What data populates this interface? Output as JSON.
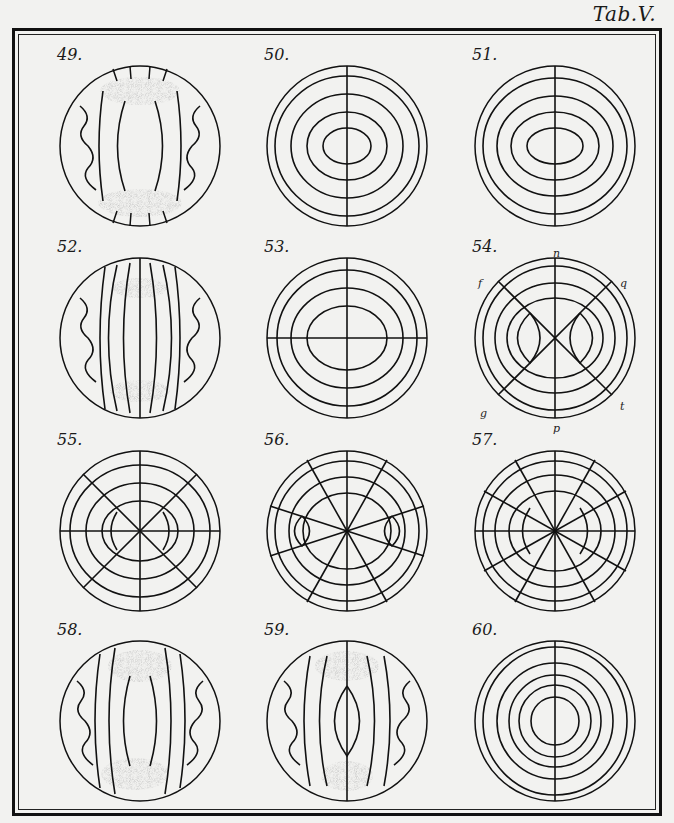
{
  "plate": {
    "title": "Tab.V."
  },
  "figures": [
    {
      "id": "49",
      "label": "49.",
      "type": "fringes-shaded"
    },
    {
      "id": "50",
      "label": "50.",
      "type": "rings-axis"
    },
    {
      "id": "51",
      "label": "51.",
      "type": "rings-axis"
    },
    {
      "id": "52",
      "label": "52.",
      "type": "fringes-shaded"
    },
    {
      "id": "53",
      "label": "53.",
      "type": "rings-cross"
    },
    {
      "id": "54",
      "label": "54.",
      "type": "rings-diagonal",
      "letters": [
        "n",
        "f",
        "q",
        "g",
        "t",
        "p"
      ]
    },
    {
      "id": "55",
      "label": "55.",
      "type": "radial-8"
    },
    {
      "id": "56",
      "label": "56.",
      "type": "radial-hyperbolic"
    },
    {
      "id": "57",
      "label": "57.",
      "type": "radial-12"
    },
    {
      "id": "58",
      "label": "58.",
      "type": "fringes-shaded"
    },
    {
      "id": "59",
      "label": "59.",
      "type": "fringes-shaded-axis"
    },
    {
      "id": "60",
      "label": "60.",
      "type": "rings-axis"
    }
  ],
  "colors": {
    "ink": "#111111",
    "paper": "#f2f2f0",
    "shade": "#8a8a8a"
  }
}
